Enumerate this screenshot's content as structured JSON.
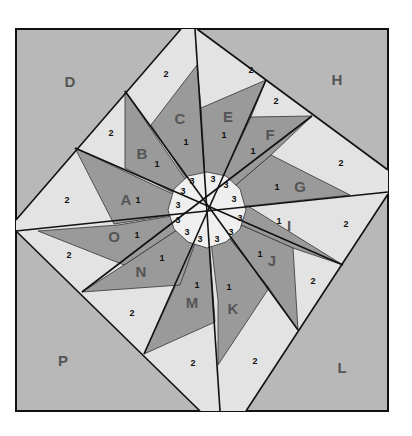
{
  "diagram": {
    "colors": {
      "background": "#b8b8b8",
      "dark": "#9a9a9a",
      "light": "#e3e3e3",
      "center": "#efefef",
      "line": "#111111",
      "label": "#555555"
    },
    "corners": [
      {
        "id": "D",
        "label": "D",
        "x": 70,
        "y": 83
      },
      {
        "id": "H",
        "label": "H",
        "x": 337,
        "y": 81
      },
      {
        "id": "P",
        "label": "P",
        "x": 63,
        "y": 362
      },
      {
        "id": "L",
        "label": "L",
        "x": 342,
        "y": 369
      }
    ],
    "points": [
      {
        "id": "A",
        "label": "A",
        "x": 126,
        "y": 201,
        "num": "1",
        "nx": 138,
        "ny": 201
      },
      {
        "id": "B",
        "label": "B",
        "x": 142,
        "y": 155,
        "num": "1",
        "nx": 157,
        "ny": 165
      },
      {
        "id": "C",
        "label": "C",
        "x": 180,
        "y": 120,
        "num": "1",
        "nx": 186,
        "ny": 143
      },
      {
        "id": "E",
        "label": "E",
        "x": 228,
        "y": 118,
        "num": "1",
        "nx": 224,
        "ny": 136
      },
      {
        "id": "F",
        "label": "F",
        "x": 270,
        "y": 136,
        "num": "1",
        "nx": 253,
        "ny": 152
      },
      {
        "id": "G",
        "label": "G",
        "x": 300,
        "y": 188,
        "num": "1",
        "nx": 277,
        "ny": 188
      },
      {
        "id": "I",
        "label": "I",
        "x": 289,
        "y": 227,
        "num": "1",
        "nx": 279,
        "ny": 222
      },
      {
        "id": "J",
        "label": "J",
        "x": 272,
        "y": 262,
        "num": "1",
        "nx": 260,
        "ny": 255
      },
      {
        "id": "K",
        "label": "K",
        "x": 233,
        "y": 310,
        "num": "1",
        "nx": 229,
        "ny": 288
      },
      {
        "id": "M",
        "label": "M",
        "x": 192,
        "y": 304,
        "num": "1",
        "nx": 197,
        "ny": 286
      },
      {
        "id": "N",
        "label": "N",
        "x": 141,
        "y": 273,
        "num": "1",
        "nx": 162,
        "ny": 259
      },
      {
        "id": "O",
        "label": "O",
        "x": 114,
        "y": 238,
        "num": "1",
        "nx": 137,
        "ny": 236
      }
    ],
    "background_pieces": [
      {
        "label": "2",
        "x": 67,
        "y": 201
      },
      {
        "label": "2",
        "x": 111,
        "y": 134
      },
      {
        "label": "2",
        "x": 166,
        "y": 75
      },
      {
        "label": "2",
        "x": 251,
        "y": 71
      },
      {
        "label": "2",
        "x": 276,
        "y": 102
      },
      {
        "label": "2",
        "x": 341,
        "y": 164
      },
      {
        "label": "2",
        "x": 346,
        "y": 225
      },
      {
        "label": "2",
        "x": 313,
        "y": 282
      },
      {
        "label": "2",
        "x": 255,
        "y": 362
      },
      {
        "label": "2",
        "x": 193,
        "y": 364
      },
      {
        "label": "2",
        "x": 132,
        "y": 314
      },
      {
        "label": "2",
        "x": 69,
        "y": 256
      }
    ],
    "center_pieces": [
      {
        "label": "3",
        "x": 183,
        "y": 192
      },
      {
        "label": "3",
        "x": 192,
        "y": 182
      },
      {
        "label": "3",
        "x": 213,
        "y": 180
      },
      {
        "label": "3",
        "x": 226,
        "y": 186
      },
      {
        "label": "3",
        "x": 234,
        "y": 200
      },
      {
        "label": "3",
        "x": 240,
        "y": 219
      },
      {
        "label": "3",
        "x": 231,
        "y": 233
      },
      {
        "label": "3",
        "x": 217,
        "y": 240
      },
      {
        "label": "3",
        "x": 200,
        "y": 240
      },
      {
        "label": "3",
        "x": 187,
        "y": 233
      },
      {
        "label": "3",
        "x": 178,
        "y": 221
      },
      {
        "label": "3",
        "x": 178,
        "y": 206
      }
    ]
  }
}
